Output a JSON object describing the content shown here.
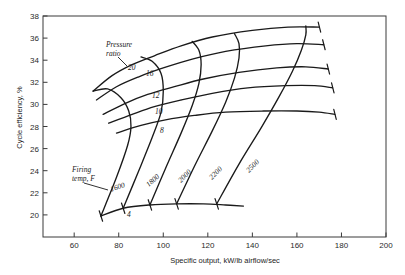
{
  "chart_data": {
    "type": "line",
    "title": "",
    "xlabel": "Specific output, kW/lb airflow/sec",
    "ylabel": "Cycle efficiency, %",
    "xlim": [
      46,
      200
    ],
    "ylim": [
      18.0,
      38.0
    ],
    "xticks": [
      60,
      80,
      100,
      120,
      140,
      160,
      180,
      200
    ],
    "yticks": [
      20,
      22,
      24,
      26,
      28,
      30,
      32,
      34,
      36,
      38
    ],
    "grid": false,
    "legend": "none",
    "annotations": [
      {
        "name": "pressure-ratio-callout",
        "text": "Pressure\nratio"
      },
      {
        "name": "firing-temp-callout",
        "text": "Firing\ntemp, F"
      }
    ],
    "series_pressure_ratio": [
      {
        "name": "20",
        "label": "20",
        "points": [
          [
            68.5,
            31.2
          ],
          [
            77,
            32.6
          ],
          [
            86,
            33.6
          ],
          [
            96,
            34.4
          ],
          [
            108,
            35.3
          ],
          [
            122,
            36.1
          ],
          [
            140,
            36.7
          ],
          [
            156,
            37.0
          ],
          [
            170,
            37.0
          ]
        ]
      },
      {
        "name": "16",
        "label": "16",
        "points": [
          [
            70,
            30.4
          ],
          [
            79,
            31.6
          ],
          [
            89,
            32.5
          ],
          [
            100,
            33.3
          ],
          [
            113,
            34.1
          ],
          [
            128,
            34.8
          ],
          [
            146,
            35.3
          ],
          [
            160,
            35.5
          ],
          [
            172,
            35.4
          ]
        ]
      },
      {
        "name": "12",
        "label": "12",
        "points": [
          [
            73,
            29.1
          ],
          [
            83,
            30.1
          ],
          [
            93,
            30.9
          ],
          [
            105,
            31.6
          ],
          [
            118,
            32.3
          ],
          [
            134,
            32.9
          ],
          [
            151,
            33.3
          ],
          [
            164,
            33.4
          ],
          [
            174,
            33.2
          ]
        ]
      },
      {
        "name": "10",
        "label": "10",
        "points": [
          [
            75.5,
            28.3
          ],
          [
            86,
            29.1
          ],
          [
            96,
            29.8
          ],
          [
            108,
            30.4
          ],
          [
            122,
            31.0
          ],
          [
            138,
            31.5
          ],
          [
            155,
            31.7
          ],
          [
            168,
            31.7
          ],
          [
            176,
            31.5
          ]
        ]
      },
      {
        "name": "8",
        "label": "8",
        "points": [
          [
            79,
            27.4
          ],
          [
            90,
            28.1
          ],
          [
            101,
            28.6
          ],
          [
            114,
            29.0
          ],
          [
            128,
            29.3
          ],
          [
            145,
            29.4
          ],
          [
            160,
            29.4
          ],
          [
            170,
            29.3
          ],
          [
            177,
            29.1
          ]
        ]
      },
      {
        "name": "4",
        "label": "4",
        "points": [
          [
            72,
            19.9
          ],
          [
            82,
            20.6
          ],
          [
            94,
            20.9
          ],
          [
            106,
            21.0
          ],
          [
            118,
            21.0
          ],
          [
            128,
            20.9
          ],
          [
            136,
            20.8
          ]
        ]
      }
    ],
    "series_firing_temp": [
      {
        "name": "1600",
        "label": "1600",
        "points": [
          [
            72,
            19.9
          ],
          [
            79,
            23.4
          ],
          [
            84,
            26.3
          ],
          [
            85.5,
            28.0
          ],
          [
            84.5,
            29.4
          ],
          [
            81,
            30.6
          ],
          [
            75,
            31.4
          ],
          [
            68.5,
            31.2
          ]
        ]
      },
      {
        "name": "1800",
        "label": "1800",
        "points": [
          [
            82,
            20.6
          ],
          [
            89,
            24.0
          ],
          [
            95,
            27.0
          ],
          [
            99,
            29.3
          ],
          [
            100,
            31.2
          ],
          [
            99,
            32.8
          ],
          [
            95,
            33.9
          ],
          [
            90,
            34.3
          ]
        ]
      },
      {
        "name": "2000",
        "label": "2000",
        "points": [
          [
            94,
            20.9
          ],
          [
            101,
            24.2
          ],
          [
            108,
            27.4
          ],
          [
            113,
            29.9
          ],
          [
            116,
            31.9
          ],
          [
            117,
            33.6
          ],
          [
            116,
            34.9
          ],
          [
            113,
            35.7
          ]
        ]
      },
      {
        "name": "2200",
        "label": "2200",
        "points": [
          [
            106,
            21.0
          ],
          [
            114,
            24.4
          ],
          [
            122,
            27.6
          ],
          [
            128,
            30.2
          ],
          [
            132,
            32.4
          ],
          [
            134,
            34.2
          ],
          [
            134,
            35.5
          ],
          [
            132,
            36.4
          ]
        ]
      },
      {
        "name": "2500",
        "label": "2500",
        "points": [
          [
            124,
            21.0
          ],
          [
            134,
            24.6
          ],
          [
            144,
            27.9
          ],
          [
            152,
            30.7
          ],
          [
            158,
            33.0
          ],
          [
            162,
            34.9
          ],
          [
            164,
            36.3
          ],
          [
            164,
            37.1
          ]
        ]
      }
    ],
    "tick_marks": [
      {
        "x": 170,
        "y": 37.0
      },
      {
        "x": 172,
        "y": 35.4
      },
      {
        "x": 174,
        "y": 33.2
      },
      {
        "x": 176,
        "y": 31.5
      },
      {
        "x": 177,
        "y": 29.1
      }
    ]
  },
  "labels": {
    "pressure_ratio_title_line1": "Pressure",
    "pressure_ratio_title_line2": "ratio",
    "firing_temp_title_line1": "Firing",
    "firing_temp_title_line2": "temp, F",
    "pr_20": "20",
    "pr_16": "16",
    "pr_12": "12",
    "pr_10": "10",
    "pr_8": "8",
    "pr_4": "4",
    "ft_1600": "1600",
    "ft_1800": "1800",
    "ft_2000": "2000",
    "ft_2200": "2200",
    "ft_2500": "2500"
  },
  "axes": {
    "x_label": "Specific output, kW/lb airflow/sec",
    "y_label": "Cycle efficiency, %",
    "x_tick_labels": [
      "60",
      "80",
      "100",
      "120",
      "140",
      "160",
      "180",
      "200"
    ],
    "y_tick_labels": [
      "20",
      "22",
      "24",
      "26",
      "28",
      "30",
      "32",
      "34",
      "36",
      "38"
    ]
  },
  "colors": {
    "curve": "#1a1a1a",
    "axis": "#3a3a3a",
    "background": "#ffffff"
  }
}
